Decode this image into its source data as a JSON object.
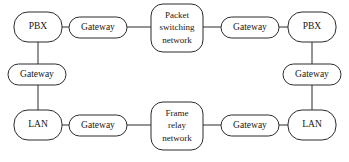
{
  "diagram": {
    "type": "network-topology",
    "canvas": {
      "width": 349,
      "height": 162
    },
    "style": {
      "line_color": "#2b2b2b",
      "node_fill": "#ffffff",
      "text_color": "#171717",
      "background": "#ffffff"
    },
    "nodes": [
      {
        "id": "pbx-left",
        "label": "PBX",
        "shape": "rounded-rect",
        "x": 14,
        "y": 12,
        "w": 48,
        "h": 30,
        "r": 14,
        "lines": [
          "PBX"
        ]
      },
      {
        "id": "gateway-top-left",
        "label": "Gateway",
        "shape": "stadium",
        "x": 69,
        "y": 17,
        "w": 58,
        "h": 21,
        "r": 10.5,
        "lines": [
          "Gateway"
        ]
      },
      {
        "id": "packet-switching-network",
        "label": "Packet switching network",
        "shape": "rounded-rect",
        "x": 151,
        "y": 4,
        "w": 52,
        "h": 48,
        "r": 12,
        "lines": [
          "Packet",
          "switching",
          "network"
        ]
      },
      {
        "id": "gateway-top-right",
        "label": "Gateway",
        "shape": "stadium",
        "x": 221,
        "y": 17,
        "w": 58,
        "h": 21,
        "r": 10.5,
        "lines": [
          "Gateway"
        ]
      },
      {
        "id": "pbx-right",
        "label": "PBX",
        "shape": "rounded-rect",
        "x": 288,
        "y": 12,
        "w": 48,
        "h": 30,
        "r": 14,
        "lines": [
          "PBX"
        ]
      },
      {
        "id": "gateway-mid-left",
        "label": "Gateway",
        "shape": "stadium",
        "x": 8,
        "y": 64,
        "w": 58,
        "h": 21,
        "r": 10.5,
        "lines": [
          "Gateway"
        ]
      },
      {
        "id": "gateway-mid-right",
        "label": "Gateway",
        "shape": "stadium",
        "x": 283,
        "y": 64,
        "w": 58,
        "h": 21,
        "r": 10.5,
        "lines": [
          "Gateway"
        ]
      },
      {
        "id": "lan-left",
        "label": "LAN",
        "shape": "rounded-rect",
        "x": 14,
        "y": 110,
        "w": 48,
        "h": 30,
        "r": 14,
        "lines": [
          "LAN"
        ]
      },
      {
        "id": "gateway-bottom-left",
        "label": "Gateway",
        "shape": "stadium",
        "x": 69,
        "y": 115,
        "w": 58,
        "h": 21,
        "r": 10.5,
        "lines": [
          "Gateway"
        ]
      },
      {
        "id": "frame-relay-network",
        "label": "Frame relay network",
        "shape": "rounded-rect",
        "x": 151,
        "y": 102,
        "w": 52,
        "h": 48,
        "r": 12,
        "lines": [
          "Frame",
          "relay",
          "network"
        ]
      },
      {
        "id": "gateway-bottom-right",
        "label": "Gateway",
        "shape": "stadium",
        "x": 221,
        "y": 115,
        "w": 58,
        "h": 21,
        "r": 10.5,
        "lines": [
          "Gateway"
        ]
      },
      {
        "id": "lan-right",
        "label": "LAN",
        "shape": "rounded-rect",
        "x": 288,
        "y": 110,
        "w": 48,
        "h": 30,
        "r": 14,
        "lines": [
          "LAN"
        ]
      }
    ],
    "links": [
      {
        "id": "link-pbxleft-gwtopleft",
        "from": "pbx-left",
        "to": "gateway-top-left",
        "orientation": "horizontal",
        "x1": 62,
        "y1": 27,
        "x2": 69,
        "y2": 27
      },
      {
        "id": "link-gwtopleft-psn",
        "from": "gateway-top-left",
        "to": "packet-switching-network",
        "orientation": "horizontal",
        "x1": 127,
        "y1": 27,
        "x2": 151,
        "y2": 27
      },
      {
        "id": "link-psn-gwtopright",
        "from": "packet-switching-network",
        "to": "gateway-top-right",
        "orientation": "horizontal",
        "x1": 203,
        "y1": 27,
        "x2": 221,
        "y2": 27
      },
      {
        "id": "link-gwtopright-pbxright",
        "from": "gateway-top-right",
        "to": "pbx-right",
        "orientation": "horizontal",
        "x1": 279,
        "y1": 27,
        "x2": 288,
        "y2": 27
      },
      {
        "id": "link-pbxleft-gwmidleft",
        "from": "pbx-left",
        "to": "gateway-mid-left",
        "orientation": "vertical",
        "x1": 38,
        "y1": 42,
        "x2": 38,
        "y2": 64
      },
      {
        "id": "link-gwmidleft-lanleft",
        "from": "gateway-mid-left",
        "to": "lan-left",
        "orientation": "vertical",
        "x1": 38,
        "y1": 85,
        "x2": 38,
        "y2": 110
      },
      {
        "id": "link-pbxright-gwmidright",
        "from": "pbx-right",
        "to": "gateway-mid-right",
        "orientation": "vertical",
        "x1": 312,
        "y1": 42,
        "x2": 312,
        "y2": 64
      },
      {
        "id": "link-gwmidright-lanright",
        "from": "gateway-mid-right",
        "to": "lan-right",
        "orientation": "vertical",
        "x1": 312,
        "y1": 85,
        "x2": 312,
        "y2": 110
      },
      {
        "id": "link-lanleft-gwbottomleft",
        "from": "lan-left",
        "to": "gateway-bottom-left",
        "orientation": "horizontal",
        "x1": 62,
        "y1": 125,
        "x2": 69,
        "y2": 125
      },
      {
        "id": "link-gwbottomleft-frn",
        "from": "gateway-bottom-left",
        "to": "frame-relay-network",
        "orientation": "horizontal",
        "x1": 127,
        "y1": 125,
        "x2": 151,
        "y2": 125
      },
      {
        "id": "link-frn-gwbottomright",
        "from": "frame-relay-network",
        "to": "gateway-bottom-right",
        "orientation": "horizontal",
        "x1": 203,
        "y1": 125,
        "x2": 221,
        "y2": 125
      },
      {
        "id": "link-gwbottomright-lanright",
        "from": "gateway-bottom-right",
        "to": "lan-right",
        "orientation": "horizontal",
        "x1": 279,
        "y1": 125,
        "x2": 288,
        "y2": 125
      }
    ]
  }
}
